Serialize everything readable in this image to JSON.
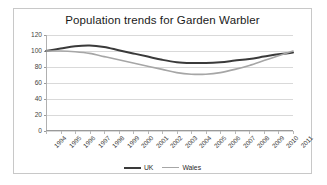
{
  "chart_data": {
    "type": "line",
    "title": "Population trends for Garden Warbler",
    "xlabel": "",
    "ylabel": "",
    "ylim": [
      0,
      120
    ],
    "yticks": [
      0,
      20,
      40,
      60,
      80,
      100,
      120
    ],
    "grid": true,
    "legend_position": "bottom",
    "categories": [
      "1994",
      "1995",
      "1996",
      "1997",
      "1998",
      "1999",
      "2000",
      "2001",
      "2002",
      "2003",
      "2004",
      "2005",
      "2006",
      "2007",
      "2008",
      "2009",
      "2010",
      "2011"
    ],
    "series": [
      {
        "name": "UK",
        "color": "#3a3a3a",
        "values": [
          100,
          103,
          106,
          107,
          105,
          101,
          97,
          93,
          89,
          86,
          85,
          85,
          86,
          88,
          90,
          93,
          96,
          98
        ]
      },
      {
        "name": "Wales",
        "color": "#a6a6a6",
        "values": [
          100,
          100,
          99,
          97,
          93,
          89,
          85,
          81,
          77,
          73,
          71,
          71,
          73,
          77,
          82,
          88,
          94,
          100
        ]
      }
    ]
  },
  "legend": {
    "items": [
      {
        "label": "UK"
      },
      {
        "label": "Wales"
      }
    ]
  }
}
